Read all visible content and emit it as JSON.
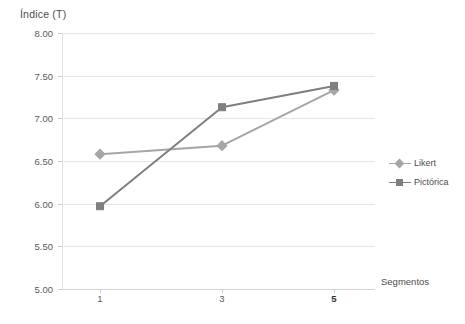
{
  "chart_data": {
    "type": "line",
    "title": "",
    "ylabel": "Índice (T)",
    "xlabel": "Segmentos",
    "categories": [
      "1",
      "3",
      "5"
    ],
    "emphasized_category": "5",
    "ylim": [
      5.0,
      8.0
    ],
    "ytick_labels": [
      "8.00",
      "7.50",
      "7.00",
      "6.50",
      "6.00",
      "5.50",
      "5.00"
    ],
    "ytick_values": [
      8.0,
      7.5,
      7.0,
      6.5,
      6.0,
      5.5,
      5.0
    ],
    "grid": true,
    "legend_position": "middle-right-outside",
    "series": [
      {
        "name": "Likert",
        "values": [
          6.58,
          6.68,
          7.33
        ],
        "color": "#a6a6a6",
        "marker": "diamond"
      },
      {
        "name": "Pictórica",
        "values": [
          5.97,
          7.13,
          7.38
        ],
        "color": "#7f7f7f",
        "marker": "square"
      }
    ]
  },
  "colors": {
    "gridline": "#e6e6e6",
    "axis": "#d4d4d4",
    "text": "#595959"
  }
}
